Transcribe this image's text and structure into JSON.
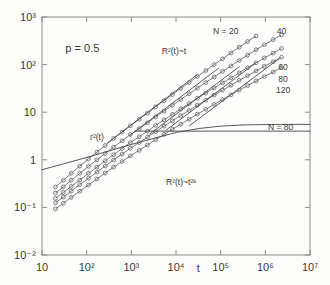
{
  "figure": {
    "background_color": "#fdfdfc",
    "frame_color": "#8a8a88",
    "ink_color": "#444444",
    "marker_color": "#5a5a5a"
  },
  "chart_data": {
    "type": "line",
    "title": "",
    "subtitle": "",
    "xlabel": "t",
    "ylabel": "",
    "xscale": "log",
    "yscale": "log",
    "xlim": [
      10,
      10000000
    ],
    "ylim": [
      0.01,
      1000
    ],
    "grid": false,
    "legend_position": "inline-curve-labels",
    "xtick_labels": [
      "10",
      "10²",
      "10³",
      "10⁴",
      "10⁵",
      "10⁶",
      "10⁷"
    ],
    "xtick_values": [
      10,
      100,
      1000,
      10000,
      100000,
      1000000,
      10000000
    ],
    "ytick_labels": [
      "10³",
      "10²",
      "10",
      "1",
      "10⁻¹",
      "10⁻²"
    ],
    "ytick_values": [
      1000,
      100,
      10,
      1,
      0.1,
      0.01
    ],
    "marker": "open-circle",
    "annotations": [
      {
        "name": "p-value",
        "text": "p = 0.5",
        "x": 80,
        "y": 180
      },
      {
        "name": "r2-of-t",
        "text": "r²(t)",
        "x": 170,
        "y": 2.6
      },
      {
        "name": "R2-linear-regime",
        "text": "R²(t)~t",
        "x": 9000,
        "y": 170
      },
      {
        "name": "R2-anomalous-regime",
        "text": "R²(t)~t²ᵏ",
        "x": 13000,
        "y": 0.3
      },
      {
        "name": "plateau-label",
        "text": "N = 80",
        "x": 2200000,
        "y": 4.3
      }
    ],
    "series": [
      {
        "name": "N = 20",
        "label": "N = 20",
        "label_x": 130000,
        "label_y": 430,
        "x": [
          20,
          30,
          45,
          70,
          110,
          170,
          260,
          400,
          620,
          950,
          1500,
          2300,
          3500,
          5400,
          8300,
          12800,
          19700,
          30000,
          46500,
          71500,
          110000,
          170000,
          260000,
          400000,
          620000
        ],
        "y": [
          0.27,
          0.37,
          0.52,
          0.74,
          1.05,
          1.45,
          2.0,
          2.8,
          3.8,
          5.2,
          7.1,
          9.6,
          13.0,
          17.5,
          23.5,
          31.5,
          42.0,
          56.0,
          75.0,
          100.0,
          132.0,
          176.0,
          232.0,
          305.0,
          400.0
        ]
      },
      {
        "name": "N = 40",
        "label": "40",
        "label_x": 2300000,
        "label_y": 430,
        "x": [
          20,
          30,
          45,
          70,
          110,
          170,
          260,
          400,
          620,
          950,
          1500,
          2300,
          3500,
          5400,
          8300,
          12800,
          19700,
          30000,
          46500,
          71500,
          110000,
          170000,
          260000,
          400000,
          620000,
          950000,
          1500000,
          2300000
        ],
        "y": [
          0.2,
          0.27,
          0.37,
          0.52,
          0.73,
          1.0,
          1.36,
          1.85,
          2.5,
          3.4,
          4.5,
          6.0,
          8.0,
          10.6,
          14.0,
          18.5,
          24.5,
          32.0,
          42.0,
          55.0,
          72.0,
          94.0,
          122.0,
          158.0,
          205.0,
          262.0,
          335.0,
          420.0
        ]
      },
      {
        "name": "N = 60",
        "label": "60",
        "label_x": 2500000,
        "label_y": 78,
        "x": [
          20,
          30,
          45,
          70,
          110,
          170,
          260,
          400,
          620,
          950,
          1500,
          2300,
          3500,
          5400,
          8300,
          12800,
          19700,
          30000,
          46500,
          71500,
          110000,
          170000,
          260000,
          400000,
          620000,
          950000,
          1500000,
          2300000
        ],
        "y": [
          0.155,
          0.205,
          0.275,
          0.375,
          0.52,
          0.7,
          0.95,
          1.28,
          1.72,
          2.3,
          3.05,
          4.0,
          5.3,
          6.9,
          9.0,
          11.7,
          15.2,
          19.6,
          25.2,
          32.3,
          41.5,
          53.0,
          67.5,
          86.0,
          109.0,
          138.0,
          174.0,
          218.0
        ]
      },
      {
        "name": "N = 80",
        "label": "80",
        "label_x": 2500000,
        "label_y": 44,
        "x": [
          20,
          30,
          45,
          70,
          110,
          170,
          260,
          400,
          620,
          950,
          1500,
          2300,
          3500,
          5400,
          8300,
          12800,
          19700,
          30000,
          46500,
          71500,
          110000,
          170000,
          260000,
          400000,
          620000,
          950000,
          1500000,
          2300000
        ],
        "y": [
          0.125,
          0.165,
          0.22,
          0.3,
          0.41,
          0.55,
          0.74,
          0.99,
          1.32,
          1.75,
          2.3,
          3.0,
          3.9,
          5.1,
          6.6,
          8.5,
          10.9,
          14.0,
          17.9,
          22.8,
          29.0,
          36.8,
          46.5,
          58.5,
          73.5,
          92.0,
          115.0,
          143.0
        ]
      },
      {
        "name": "N = 120",
        "label": "120",
        "label_x": 2500000,
        "label_y": 25,
        "x": [
          20,
          30,
          45,
          70,
          110,
          170,
          260,
          400,
          620,
          950,
          1500,
          2300,
          3500,
          5400,
          8300,
          12800,
          19700,
          30000,
          46500,
          71500,
          110000,
          170000,
          260000,
          400000,
          620000,
          950000,
          1500000,
          2300000
        ],
        "y": [
          0.093,
          0.122,
          0.162,
          0.218,
          0.295,
          0.395,
          0.525,
          0.7,
          0.92,
          1.21,
          1.58,
          2.05,
          2.65,
          3.42,
          4.4,
          5.6,
          7.15,
          9.1,
          11.5,
          14.6,
          18.4,
          23.2,
          29.0,
          36.3,
          45.3,
          56.3,
          70.0,
          86.5
        ]
      }
    ],
    "guide_lines": [
      {
        "name": "r2-of-t-curve",
        "label": "r²(t)",
        "x": [
          10,
          30,
          100,
          330,
          1000,
          3300,
          10000,
          33000,
          100000,
          330000,
          1000000,
          3300000,
          10000000
        ],
        "y": [
          0.62,
          0.82,
          1.12,
          1.55,
          2.1,
          2.85,
          3.75,
          4.55,
          5.1,
          5.4,
          5.5,
          5.55,
          5.55
        ]
      },
      {
        "name": "plateau-line-N80",
        "label": "N = 80",
        "x": [
          1200,
          10000000
        ],
        "y": [
          4.0,
          4.0
        ]
      },
      {
        "name": "slope1-guide-N20",
        "x": [
          300,
          30000
        ],
        "y": [
          2.3,
          62.0
        ]
      },
      {
        "name": "slope1-guide-N40",
        "x": [
          900,
          90000
        ],
        "y": [
          3.2,
          84.0
        ]
      },
      {
        "name": "slope1-guide-N60",
        "x": [
          2600,
          260000
        ],
        "y": [
          3.5,
          90.0
        ]
      },
      {
        "name": "slope1-guide-N80",
        "x": [
          6000,
          600000
        ],
        "y": [
          4.2,
          107.0
        ]
      },
      {
        "name": "slope1-guide-N120",
        "x": [
          20000,
          2000000
        ],
        "y": [
          5.2,
          132.0
        ]
      }
    ]
  }
}
